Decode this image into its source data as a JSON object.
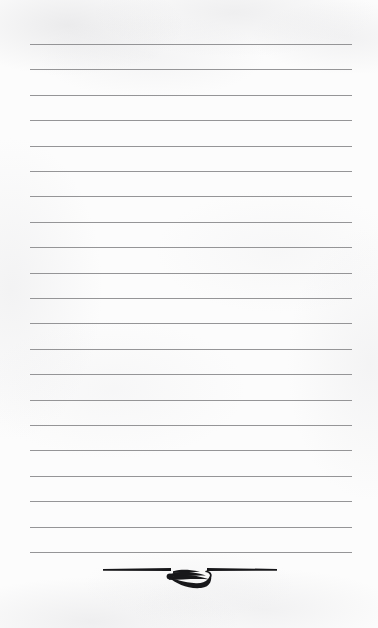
{
  "page": {
    "kind": "lined-notepad-page",
    "label": "Blank ruled writing paper",
    "width": 378,
    "height": 628,
    "background_color": "#fcfcfc",
    "paper_texture": "faint-scan-mottling"
  },
  "ruled_lines": {
    "label": "Ruled writing lines",
    "count": 21,
    "color": "#8c8c8e",
    "thickness_px": 1,
    "spacing_px": 25.4,
    "left_px": 30,
    "right_px": 352,
    "first_line_y_px": 44,
    "last_line_y_px": 552,
    "y_positions": [
      44,
      69.4,
      94.8,
      120.2,
      145.6,
      171,
      196.4,
      221.8,
      247.2,
      272.6,
      298,
      323.4,
      348.8,
      374.2,
      399.6,
      425,
      450.4,
      475.8,
      501.2,
      526.6,
      552
    ]
  },
  "ornament": {
    "label": "Decorative flourish",
    "icon": "leaf-flourish-ornament",
    "color": "#17171a",
    "center_x_px": 189,
    "top_px": 562,
    "bar_left_start_px": 103,
    "bar_right_end_px": 277,
    "bar_thickness_px": 3,
    "flourish_left_px": 165,
    "flourish_right_px": 213
  },
  "text_content": {
    "body_text": "",
    "note": "Page is blank — no handwriting or printed text present"
  }
}
